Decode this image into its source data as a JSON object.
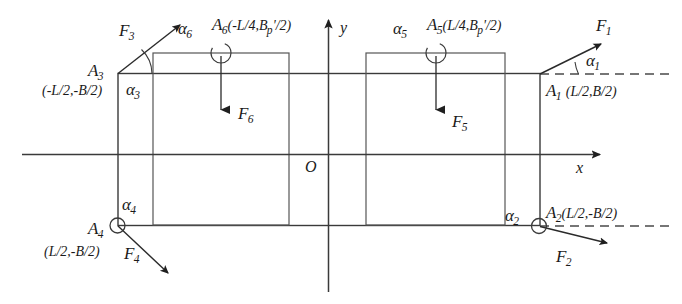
{
  "figure": {
    "type": "free-body-force-diagram",
    "axes": {
      "x_label": "x",
      "y_label": "y",
      "origin_label": "O"
    },
    "points": [
      {
        "id": "A1",
        "name": "A",
        "sub": "1",
        "coords": "(L/2,B/2)",
        "angle_label": "α",
        "angle_sub": "1"
      },
      {
        "id": "A2",
        "name": "A",
        "sub": "2",
        "coords": "(L/2,-B/2)",
        "angle_label": "α",
        "angle_sub": "2"
      },
      {
        "id": "A3",
        "name": "A",
        "sub": "3",
        "coords": "(-L/2,-B/2)",
        "angle_label": "α",
        "angle_sub": "3"
      },
      {
        "id": "A4",
        "name": "A",
        "sub": "4",
        "coords": "(L/2,-B/2)",
        "angle_label": "α",
        "angle_sub": "4"
      },
      {
        "id": "A5",
        "name": "A",
        "sub": "5",
        "coords": "(L/4,B",
        "coords_sub": "p",
        "coords_tail": "'/2)",
        "angle_label": "α",
        "angle_sub": "5"
      },
      {
        "id": "A6",
        "name": "A",
        "sub": "6",
        "coords": "(-L/4,B",
        "coords_sub": "p",
        "coords_tail": "'/2)",
        "angle_label": "α",
        "angle_sub": "6"
      }
    ],
    "forces": [
      {
        "id": "F1",
        "name": "F",
        "sub": "1",
        "direction": "up-right"
      },
      {
        "id": "F2",
        "name": "F",
        "sub": "2",
        "direction": "down-right"
      },
      {
        "id": "F3",
        "name": "F",
        "sub": "3",
        "direction": "up-right"
      },
      {
        "id": "F4",
        "name": "F",
        "sub": "4",
        "direction": "down-right"
      },
      {
        "id": "F5",
        "name": "F",
        "sub": "5",
        "direction": "down"
      },
      {
        "id": "F6",
        "name": "F",
        "sub": "6",
        "direction": "down"
      }
    ],
    "colors": {
      "line": "#3a3a3a",
      "text": "#1a1a1a",
      "background": "#ffffff"
    },
    "labels": {
      "A1_name": "A",
      "A1_sub": "1",
      "A1_coords": "(L/2,B/2)",
      "A2_name": "A",
      "A2_sub": "2",
      "A2_coords": "(L/2,-B/2)",
      "A3_name": "A",
      "A3_sub": "3",
      "A3_coords": "(-L/2,-B/2)",
      "A4_name": "A",
      "A4_sub": "4",
      "A4_coords": "(L/2,-B/2)",
      "A5_name": "A",
      "A5_sub": "5",
      "A5_coords_head": "(L/4,B",
      "A5_coords_sub": "p",
      "A5_coords_tail": "'/2)",
      "A6_name": "A",
      "A6_sub": "6",
      "A6_coords_head": "(-L/4,B",
      "A6_coords_sub": "p",
      "A6_coords_tail": "'/2)",
      "F1_name": "F",
      "F1_sub": "1",
      "F2_name": "F",
      "F2_sub": "2",
      "F3_name": "F",
      "F3_sub": "3",
      "F4_name": "F",
      "F4_sub": "4",
      "F5_name": "F",
      "F5_sub": "5",
      "F6_name": "F",
      "F6_sub": "6",
      "alpha1": "α",
      "alpha1_sub": "1",
      "alpha2": "α",
      "alpha2_sub": "2",
      "alpha3": "α",
      "alpha3_sub": "3",
      "alpha4": "α",
      "alpha4_sub": "4",
      "alpha5": "α",
      "alpha5_sub": "5",
      "alpha6": "α",
      "alpha6_sub": "6",
      "axis_x": "x",
      "axis_y": "y",
      "origin": "O"
    }
  }
}
